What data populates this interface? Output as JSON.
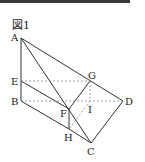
{
  "figure": {
    "title": "図1",
    "points": {
      "A": {
        "label": "A",
        "x": 21,
        "y": 38
      },
      "E": {
        "label": "E",
        "x": 21,
        "y": 81
      },
      "B": {
        "label": "B",
        "x": 21,
        "y": 101
      },
      "G": {
        "label": "G",
        "x": 90,
        "y": 81
      },
      "D": {
        "label": "D",
        "x": 123,
        "y": 101
      },
      "I": {
        "label": "I",
        "x": 90,
        "y": 101
      },
      "F": {
        "label": "F",
        "x": 69,
        "y": 109
      },
      "H": {
        "label": "H",
        "x": 69,
        "y": 129
      },
      "C": {
        "label": "C",
        "x": 91,
        "y": 143
      }
    },
    "solid_edges": [
      [
        "A",
        "B"
      ],
      [
        "A",
        "D"
      ],
      [
        "A",
        "C"
      ],
      [
        "D",
        "C"
      ],
      [
        "B",
        "H"
      ],
      [
        "H",
        "C"
      ],
      [
        "E",
        "F"
      ],
      [
        "F",
        "G"
      ],
      [
        "F",
        "H"
      ]
    ],
    "dashed_edges": [
      [
        "E",
        "G"
      ],
      [
        "B",
        "D"
      ],
      [
        "G",
        "I"
      ],
      [
        "I",
        "H"
      ]
    ],
    "colors": {
      "line": "#333333",
      "dashed": "#888888",
      "topbar": "#3a3a3a"
    }
  }
}
